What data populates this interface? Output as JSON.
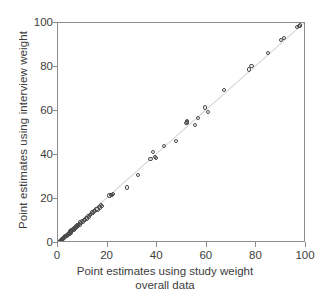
{
  "chart_data": {
    "type": "scatter",
    "title": "",
    "xlabel": "Point estimates using study weight overall data",
    "xlabel_line1": "Point estimates using study weight",
    "xlabel_line2": "overall data",
    "ylabel": "Point estimates using interview weight",
    "xlim": [
      0,
      100
    ],
    "ylim": [
      0,
      100
    ],
    "xticks": [
      0,
      20,
      40,
      60,
      80,
      100
    ],
    "yticks": [
      0,
      20,
      40,
      60,
      80,
      100
    ],
    "xtick_labels": [
      "0",
      "20",
      "40",
      "60",
      "80",
      "100"
    ],
    "ytick_labels": [
      "0",
      "20",
      "40",
      "60",
      "80",
      "100"
    ],
    "grid": false,
    "legend": null,
    "marker": "open-circle",
    "marker_color": "#4a4a4a",
    "reference_line": {
      "type": "identity",
      "from": [
        0,
        0
      ],
      "to": [
        100,
        100
      ],
      "color": "#d8d8d8"
    },
    "points": [
      [
        0.2,
        0.1
      ],
      [
        0.4,
        0.3
      ],
      [
        0.5,
        0.6
      ],
      [
        0.7,
        0.4
      ],
      [
        0.8,
        0.9
      ],
      [
        1.0,
        0.8
      ],
      [
        1.1,
        1.3
      ],
      [
        1.3,
        1.1
      ],
      [
        1.5,
        1.6
      ],
      [
        1.6,
        1.4
      ],
      [
        1.8,
        2.0
      ],
      [
        2.0,
        1.8
      ],
      [
        2.2,
        2.4
      ],
      [
        2.4,
        2.2
      ],
      [
        2.6,
        2.8
      ],
      [
        2.8,
        2.6
      ],
      [
        3.0,
        3.2
      ],
      [
        3.2,
        3.0
      ],
      [
        3.5,
        3.7
      ],
      [
        3.7,
        3.4
      ],
      [
        3.9,
        4.2
      ],
      [
        4.1,
        3.9
      ],
      [
        4.4,
        4.6
      ],
      [
        4.6,
        4.3
      ],
      [
        4.9,
        5.2
      ],
      [
        5.1,
        4.8
      ],
      [
        5.4,
        5.7
      ],
      [
        5.7,
        5.4
      ],
      [
        6.0,
        6.3
      ],
      [
        6.3,
        6.0
      ],
      [
        6.6,
        6.9
      ],
      [
        6.9,
        6.6
      ],
      [
        7.2,
        7.5
      ],
      [
        7.5,
        7.2
      ],
      [
        7.8,
        8.1
      ],
      [
        8.1,
        7.8
      ],
      [
        8.4,
        8.7
      ],
      [
        8.7,
        8.3
      ],
      [
        9.0,
        9.3
      ],
      [
        9.3,
        9.0
      ],
      [
        9.7,
        9.9
      ],
      [
        10.0,
        9.6
      ],
      [
        10.4,
        10.6
      ],
      [
        10.8,
        10.3
      ],
      [
        11.2,
        11.4
      ],
      [
        11.6,
        11.1
      ],
      [
        12.0,
        12.2
      ],
      [
        12.4,
        11.9
      ],
      [
        12.9,
        12.7
      ],
      [
        13.3,
        13.2
      ],
      [
        13.7,
        13.9
      ],
      [
        14.1,
        13.6
      ],
      [
        14.6,
        14.7
      ],
      [
        15.0,
        14.4
      ],
      [
        15.5,
        15.6
      ],
      [
        15.9,
        15.2
      ],
      [
        16.4,
        16.5
      ],
      [
        16.8,
        16.1
      ],
      [
        17.2,
        17.4
      ],
      [
        17.6,
        17.0
      ],
      [
        20.8,
        21.6
      ],
      [
        21.4,
        22.0
      ],
      [
        21.8,
        21.9
      ],
      [
        22.2,
        22.3
      ],
      [
        27.8,
        25.2
      ],
      [
        32.3,
        31.0
      ],
      [
        37.3,
        38.0
      ],
      [
        38.4,
        41.3
      ],
      [
        39.0,
        39.2
      ],
      [
        39.6,
        38.8
      ],
      [
        42.8,
        44.2
      ],
      [
        47.5,
        46.2
      ],
      [
        51.8,
        54.6
      ],
      [
        51.9,
        54.9
      ],
      [
        52.0,
        55.2
      ],
      [
        55.2,
        53.8
      ],
      [
        56.5,
        57.0
      ],
      [
        59.4,
        61.6
      ],
      [
        60.6,
        59.7
      ],
      [
        67.0,
        69.4
      ],
      [
        77.0,
        78.9
      ],
      [
        78.0,
        80.3
      ],
      [
        84.8,
        86.2
      ],
      [
        89.8,
        92.4
      ],
      [
        91.0,
        93.1
      ],
      [
        96.4,
        98.2
      ],
      [
        97.2,
        98.6
      ],
      [
        97.6,
        98.9
      ]
    ]
  },
  "axes": {
    "y_title": "Point estimates using interview weight",
    "x_title_line1": "Point estimates using study weight",
    "x_title_line2": "overall data"
  }
}
